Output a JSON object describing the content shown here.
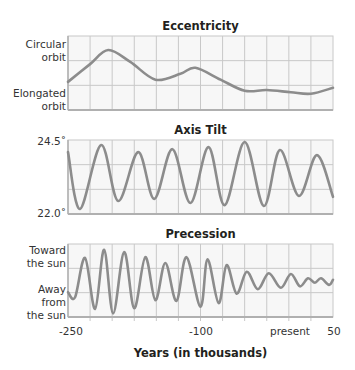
{
  "chart_data": [
    {
      "type": "line",
      "title": "Eccentricity",
      "xlabel": "Years (in thousands)",
      "ylabel": "",
      "y_tick_labels": [
        "Circular orbit",
        "Elongated orbit"
      ],
      "xlim": [
        -250,
        50
      ],
      "ylim": [
        0,
        1
      ],
      "grid": true,
      "series": [
        {
          "name": "Eccentricity",
          "x": [
            -250,
            -225,
            -204.5,
            -179.5,
            -151,
            -122.7,
            -105.7,
            -77.3,
            -50,
            -25,
            2.3,
            25,
            50
          ],
          "y": [
            0.38,
            0.62,
            0.81,
            0.65,
            0.41,
            0.49,
            0.57,
            0.41,
            0.26,
            0.27,
            0.24,
            0.22,
            0.3
          ]
        }
      ]
    },
    {
      "type": "line",
      "title": "Axis Tilt",
      "xlabel": "Years (in thousands)",
      "ylabel": "degrees",
      "y_tick_labels": [
        "24.5°",
        "22.0°"
      ],
      "xlim": [
        -250,
        50
      ],
      "ylim": [
        22.0,
        24.5
      ],
      "grid": true,
      "series": [
        {
          "name": "Axis tilt",
          "x": [
            -250,
            -236.4,
            -212.5,
            -193.2,
            -170.5,
            -152.3,
            -131.8,
            -111.4,
            -90.9,
            -72.7,
            -50,
            -28.4,
            -10.2,
            11.4,
            31.8,
            50
          ],
          "y": [
            24.09,
            22.17,
            24.33,
            22.44,
            24.09,
            22.51,
            24.19,
            22.37,
            24.26,
            22.3,
            24.43,
            22.27,
            24.16,
            22.61,
            23.99,
            22.58
          ]
        }
      ]
    },
    {
      "type": "line",
      "title": "Precession",
      "xlabel": "Years (in thousands)",
      "ylabel": "",
      "y_tick_labels": [
        "Toward the sun",
        "Away from the sun"
      ],
      "xlim": [
        -250,
        50
      ],
      "ylim": [
        0,
        1
      ],
      "grid": true,
      "series": [
        {
          "name": "Precession",
          "x": [
            -250,
            -242,
            -230.7,
            -219.3,
            -209.1,
            -198.9,
            -186.4,
            -175,
            -162.5,
            -151.1,
            -139.8,
            -127.3,
            -115.9,
            -100,
            -92,
            -79.5,
            -70.5,
            -59.1,
            -47.7,
            -35.2,
            -22.7,
            -9.1,
            2.3,
            12.5,
            21.6,
            29.5,
            36.4,
            45.5,
            50
          ],
          "y": [
            0.34,
            0.27,
            0.81,
            0.11,
            0.92,
            0.05,
            0.89,
            0.12,
            0.82,
            0.23,
            0.74,
            0.22,
            0.82,
            0.14,
            0.79,
            0.19,
            0.71,
            0.32,
            0.62,
            0.38,
            0.6,
            0.4,
            0.59,
            0.42,
            0.53,
            0.47,
            0.53,
            0.44,
            0.51
          ]
        }
      ]
    }
  ],
  "titles": {
    "eccentricity": "Eccentricity",
    "tilt": "Axis Tilt",
    "precession": "Precession"
  },
  "ylabels": {
    "ecc_top_1": "Circular",
    "ecc_top_2": "orbit",
    "ecc_bot_1": "Elongated",
    "ecc_bot_2": "orbit",
    "tilt_top": "24.5˚",
    "tilt_bot": "22.0˚",
    "prec_top_1": "Toward",
    "prec_top_2": "the sun",
    "prec_bot_1": "Away",
    "prec_bot_2": "from",
    "prec_bot_3": "the sun"
  },
  "xticks": {
    "t1": "-250",
    "t2": "-100",
    "t3": "present",
    "t4": "50"
  },
  "xlabel": "Years (in thousands)",
  "colors": {
    "line": "#8c8c8c",
    "grid": "#c8c8c8",
    "plot_bg": "#f7f7f7",
    "axis": "#b0b0b0"
  }
}
